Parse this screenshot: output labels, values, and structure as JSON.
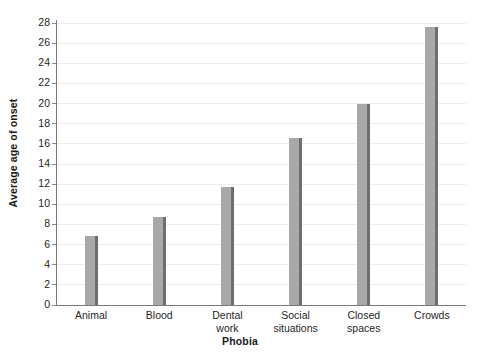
{
  "chart_data": {
    "type": "bar",
    "title": "",
    "xlabel": "Phobia",
    "ylabel": "Average age of onset",
    "categories": [
      "Animal",
      "Blood",
      "Dental work",
      "Social situations",
      "Closed spaces",
      "Crowds"
    ],
    "category_lines": [
      [
        "Animal",
        ""
      ],
      [
        "Blood",
        ""
      ],
      [
        "Dental",
        "work"
      ],
      [
        "Social",
        "situations"
      ],
      [
        "Closed",
        "spaces"
      ],
      [
        "Crowds",
        ""
      ]
    ],
    "values": [
      6.9,
      8.7,
      11.7,
      16.6,
      20.0,
      27.6
    ],
    "ylim": [
      0,
      28
    ],
    "yticks": [
      0,
      2,
      4,
      6,
      8,
      10,
      12,
      14,
      16,
      18,
      20,
      22,
      24,
      26,
      28
    ],
    "ytick_labels": [
      "0",
      "2",
      "4",
      "6",
      "8",
      "10",
      "12",
      "14",
      "16",
      "18",
      "20",
      "22",
      "24",
      "26",
      "28"
    ],
    "grid": true,
    "grid_axis": "y",
    "legend": false,
    "legend_position": "none",
    "bar_color": "#a8a8a8",
    "bar_edge_color": "#6e6e6e",
    "gridline_color": "#ededed",
    "axis_color": "#7a7a7a",
    "text_color": "#1f1f1f",
    "background": "#ffffff"
  }
}
